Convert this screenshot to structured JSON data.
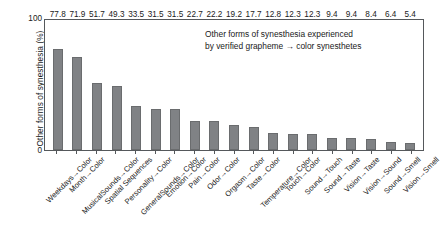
{
  "chart_data": {
    "type": "bar",
    "title": "",
    "annotation": [
      "Other forms of synesthesia experienced",
      "by verified grapheme → color synesthetes"
    ],
    "xlabel": "",
    "ylabel": "Other forms of synesthesia (%)",
    "ylim": [
      0,
      100
    ],
    "ytick_labels": [
      "0",
      "100"
    ],
    "grid": false,
    "legend": false,
    "bar_color": "#808285",
    "categories": [
      "Weekdays→Color",
      "Month→Color",
      "MusicalSounds→Color",
      "Spatial Sequences",
      "Personality→Color",
      "GeneralSounds→Color",
      "Emotion→Color",
      "Pain→Color",
      "Odor→Color",
      "Orgasm→Color",
      "Taste→Color",
      "Temperature→Color",
      "Touch→Color",
      "Sound→Touch",
      "Sound→Taste",
      "Vision→Taste",
      "Vision→Sound",
      "Sound→Smell",
      "Vision→Smell"
    ],
    "values": [
      77.8,
      71.9,
      51.7,
      49.3,
      33.5,
      31.5,
      31.5,
      22.7,
      22.2,
      19.2,
      17.7,
      12.8,
      12.3,
      12.3,
      9.4,
      9.4,
      8.4,
      6.4,
      5.4
    ],
    "value_labels": [
      "77.8",
      "71.9",
      "51.7",
      "49.3",
      "33.5",
      "31.5",
      "31.5",
      "22.7",
      "22.2",
      "19.2",
      "17.7",
      "12.8",
      "12.3",
      "12.3",
      "9.4",
      "9.4",
      "8.4",
      "6.4",
      "5.4"
    ]
  }
}
